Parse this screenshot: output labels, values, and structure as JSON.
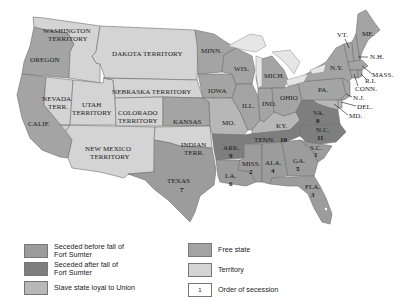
{
  "colors": {
    "seceded_before": "#9c9c9c",
    "seceded_after": "#7e7e7e",
    "slave_loyal": "#b7b7b7",
    "free_state": "#a4a4a4",
    "territory": "#d4d4d4",
    "lakes": "#e6e6e6",
    "order_box": "#ffffff"
  },
  "map": {
    "labels": {
      "washington": "WASHINGTON",
      "washington2": "TERRITORY",
      "oregon": "OREGON",
      "dakota": "DAKOTA TERRITORY",
      "nebraska": "NEBRASKA TERRITORY",
      "nevada": "NEVADA",
      "nevada2": "TERR.",
      "utah": "UTAH",
      "utah2": "TERRITORY",
      "colorado": "COLORADO",
      "colorado2": "TERRITORY",
      "california": "CALIF.",
      "kansas": "KANSAS",
      "new_mexico": "NEW MEXICO",
      "new_mexico2": "TERRITORY",
      "indian": "INDIAN",
      "indian2": "TERR.",
      "texas": "TEXAS",
      "minn": "MINN.",
      "wis": "WIS.",
      "iowa": "IOWA",
      "mich": "MICH.",
      "ill": "ILL.",
      "ind": "IND.",
      "ohio": "OHIO",
      "mo": "MO.",
      "ky": "KY.",
      "pa": "PA.",
      "ny": "N.Y.",
      "vt": "VT.",
      "me": "ME.",
      "nh": "N.H.",
      "mass": "MASS.",
      "ri": "R.I.",
      "conn": "CONN.",
      "nj": "N.J.",
      "del": "DEL.",
      "md": "MD.",
      "va": "VA.",
      "nc": "N.C.",
      "sc": "S.C.",
      "tenn": "TENN.",
      "ark": "ARK.",
      "la": "LA.",
      "miss": "MISS.",
      "ala": "ALA.",
      "ga": "GA.",
      "fla": "FLA."
    },
    "secession_order": {
      "sc": "1",
      "miss": "2",
      "fla": "3",
      "ala": "4",
      "ga": "5",
      "la": "6",
      "texas": "7",
      "va": "8",
      "ark": "9",
      "tenn": "10",
      "nc": "11"
    }
  },
  "legend": {
    "items": [
      {
        "label_line1": "Seceded before fall of",
        "label_line2": "Fort Sumter"
      },
      {
        "label_line1": "Seceded after fall of",
        "label_line2": "Fort Sumter"
      },
      {
        "label": "Slave state loyal to Union"
      },
      {
        "label": "Free state"
      },
      {
        "label": "Territory"
      },
      {
        "label": "Order of secession",
        "swatch_text": "1"
      }
    ]
  }
}
